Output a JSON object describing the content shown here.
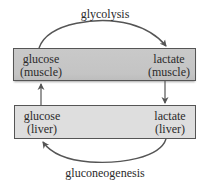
{
  "diagram": {
    "processes": {
      "top": "glycolysis",
      "bottom": "gluconeogenesis"
    },
    "nodes": {
      "glucose_muscle": {
        "line1": "glucose",
        "line2": "(muscle)"
      },
      "lactate_muscle": {
        "line1": "lactate",
        "line2": "(muscle)"
      },
      "glucose_liver": {
        "line1": "glucose",
        "line2": "(liver)"
      },
      "lactate_liver": {
        "line1": "lactate",
        "line2": "(liver)"
      }
    },
    "edges": [
      {
        "from": "glucose (muscle)",
        "to": "lactate (muscle)",
        "label": "glycolysis"
      },
      {
        "from": "lactate (muscle)",
        "to": "lactate (liver)",
        "label": ""
      },
      {
        "from": "lactate (liver)",
        "to": "glucose (liver)",
        "label": "gluconeogenesis"
      },
      {
        "from": "glucose (liver)",
        "to": "glucose (muscle)",
        "label": ""
      }
    ],
    "colors": {
      "muscle_box": "#c6c6c6",
      "liver_box": "#dedede",
      "stroke": "#555555",
      "text": "#2a2a2a"
    }
  }
}
